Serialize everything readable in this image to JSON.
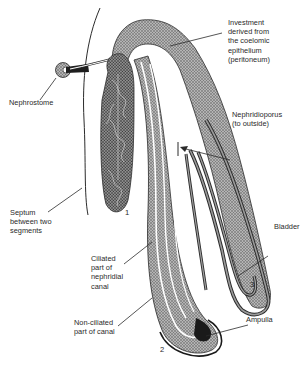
{
  "diagram": {
    "type": "anatomical illustration",
    "labels": {
      "investment": "Investment\nderived from\nthe coelomic\nepithelium\n(peritoneum)",
      "nephrostome": "Nephrostome",
      "nephridioporus": "Nephridioporus\n(to outside)",
      "septum": "Septum\nbetween two\nsegments",
      "bladder": "Bladder",
      "ciliated": "Ciliated\npart of\nnephridial\ncanal",
      "non_ciliated": "Non-ciliated\npart of canal",
      "ampulla": "Ampulla"
    },
    "numbers": {
      "loop_1": "1",
      "loop_2": "2",
      "loop_3": "3"
    },
    "colors": {
      "line": "#2b2b2b",
      "stipple": "#8a8a8a",
      "stipple_dark": "#5e5e5e",
      "background": "#ffffff"
    }
  }
}
